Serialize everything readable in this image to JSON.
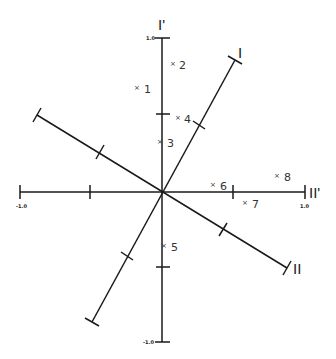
{
  "diagram": {
    "type": "factor-rotation-plot",
    "colors": {
      "line": "#1a1a1a",
      "text": "#333333",
      "background": "#ffffff"
    },
    "axes": {
      "vertical": {
        "label": "I'",
        "top_scale": "1.0",
        "bottom_scale": "-1.0"
      },
      "horizontal": {
        "label": "II'",
        "left_scale": "-1.0",
        "right_scale": "1.0"
      },
      "rotated_1": {
        "label": "I"
      },
      "rotated_2": {
        "label": "II"
      }
    },
    "points": [
      {
        "id": "1",
        "marker": "×",
        "label": "1"
      },
      {
        "id": "2",
        "marker": "×",
        "label": "2"
      },
      {
        "id": "3",
        "marker": "×",
        "label": "3"
      },
      {
        "id": "4",
        "marker": "×",
        "label": "4"
      },
      {
        "id": "5",
        "marker": "×",
        "label": "5"
      },
      {
        "id": "6",
        "marker": "×",
        "label": "6"
      },
      {
        "id": "7",
        "marker": "×",
        "label": "7"
      },
      {
        "id": "8",
        "marker": "×",
        "label": "8"
      }
    ]
  }
}
